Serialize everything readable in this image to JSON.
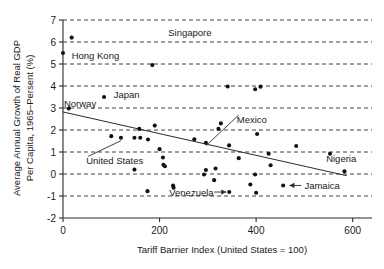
{
  "chart_data": {
    "type": "scatter",
    "title": "",
    "xlabel": "Tariff Barrier Index (United States = 100)",
    "ylabel": "Average Annual Growth of Real GDP Per Capita, 1965–Persent (%)",
    "ylabel_line1": "Average Annual Growth of Real GDP",
    "ylabel_line2": "Per Capita, 1965–Persent (%)",
    "xlim": [
      0,
      640
    ],
    "ylim": [
      -2,
      7
    ],
    "xticks": [
      0,
      200,
      400,
      600
    ],
    "xtick_labels": [
      "0",
      "200",
      "400",
      "600"
    ],
    "yticks": [
      -2,
      -1,
      0,
      1,
      2,
      3,
      4,
      5,
      6,
      7
    ],
    "ytick_labels": [
      "-2",
      "-1",
      "0",
      "1",
      "2",
      "3",
      "4",
      "5",
      "6",
      "7"
    ],
    "grid": true,
    "grid_style": "dashed-horizontal",
    "legend": "none",
    "points": [
      {
        "x": 0,
        "y": 5.5
      },
      {
        "x": 18,
        "y": 6.2
      },
      {
        "x": 12,
        "y": 2.98
      },
      {
        "x": 85,
        "y": 3.5
      },
      {
        "x": 185,
        "y": 4.95
      },
      {
        "x": 100,
        "y": 1.72
      },
      {
        "x": 120,
        "y": 1.65
      },
      {
        "x": 148,
        "y": 1.65
      },
      {
        "x": 160,
        "y": 1.65
      },
      {
        "x": 158,
        "y": 2.05
      },
      {
        "x": 176,
        "y": 1.57
      },
      {
        "x": 190,
        "y": 2.2
      },
      {
        "x": 200,
        "y": 1.13
      },
      {
        "x": 207,
        "y": 0.75
      },
      {
        "x": 208,
        "y": 0.42
      },
      {
        "x": 211,
        "y": 0.35
      },
      {
        "x": 148,
        "y": 0.2
      },
      {
        "x": 175,
        "y": -0.78
      },
      {
        "x": 228,
        "y": -0.52
      },
      {
        "x": 229,
        "y": -0.62
      },
      {
        "x": 272,
        "y": 1.58
      },
      {
        "x": 296,
        "y": 1.42
      },
      {
        "x": 296,
        "y": 0.18
      },
      {
        "x": 292,
        "y": -0.02
      },
      {
        "x": 313,
        "y": -0.28
      },
      {
        "x": 316,
        "y": 0.25
      },
      {
        "x": 322,
        "y": 2.05
      },
      {
        "x": 327,
        "y": 2.3
      },
      {
        "x": 341,
        "y": 3.98
      },
      {
        "x": 344,
        "y": 1.3
      },
      {
        "x": 364,
        "y": 0.72
      },
      {
        "x": 388,
        "y": -0.48
      },
      {
        "x": 398,
        "y": 3.85
      },
      {
        "x": 409,
        "y": 3.97
      },
      {
        "x": 402,
        "y": 1.82
      },
      {
        "x": 398,
        "y": -0.02
      },
      {
        "x": 400,
        "y": -0.85
      },
      {
        "x": 426,
        "y": 0.92
      },
      {
        "x": 430,
        "y": 0.4
      },
      {
        "x": 456,
        "y": -0.52
      },
      {
        "x": 483,
        "y": 1.27
      },
      {
        "x": 553,
        "y": 0.92
      },
      {
        "x": 583,
        "y": 0.12
      }
    ],
    "trendline": {
      "x0": 0,
      "y0": 2.82,
      "x1": 588,
      "y1": -0.08
    },
    "annotations": [
      {
        "label": "Singapore",
        "lx": 218,
        "ly": 6.42,
        "anchor": "start",
        "leader": "none"
      },
      {
        "label": "Hong Kong",
        "lx": 18,
        "ly": 5.38,
        "anchor": "start",
        "leader": "none"
      },
      {
        "label": "Japan",
        "lx": 105,
        "ly": 3.6,
        "anchor": "start",
        "leader": "none"
      },
      {
        "label": "Norway",
        "lx": 2,
        "ly": 3.22,
        "anchor": "start",
        "leader": "none"
      },
      {
        "label": "Mexico",
        "lx": 360,
        "ly": 2.5,
        "anchor": "start",
        "leader": "line",
        "tx": 296,
        "ty": 1.42
      },
      {
        "label": "United States",
        "lx": 48,
        "ly": 0.62,
        "anchor": "start",
        "leader": "line",
        "tx": 120,
        "ty": 1.65
      },
      {
        "label": "Venezuela",
        "lx": 220,
        "ly": -0.82,
        "anchor": "start",
        "leader": "arrow-right",
        "tx": 400,
        "ty": -0.85
      },
      {
        "label": "Jamaica",
        "lx": 500,
        "ly": -0.52,
        "anchor": "start",
        "leader": "arrow-left",
        "tx": 456,
        "ty": -0.52
      },
      {
        "label": "Nigeria",
        "lx": 545,
        "ly": 0.72,
        "anchor": "start",
        "leader": "none"
      }
    ]
  }
}
